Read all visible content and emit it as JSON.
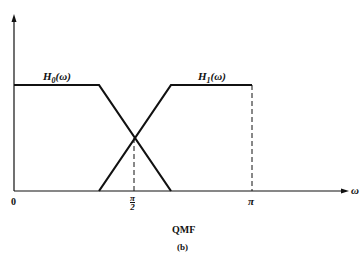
{
  "diagram": {
    "title": "QMF",
    "subtitle": "(b)",
    "x_axis_label": "ω",
    "origin_label": "0",
    "tick_half_pi": {
      "num": "π",
      "den": "2"
    },
    "tick_pi": "π",
    "curves": [
      {
        "name": "H0",
        "label_main": "H",
        "label_sub": "0",
        "label_arg": "(ω)"
      },
      {
        "name": "H1",
        "label_main": "H",
        "label_sub": "1",
        "label_arg": "(ω)"
      }
    ],
    "colors": {
      "line": "#111111",
      "background": "#ffffff"
    }
  }
}
